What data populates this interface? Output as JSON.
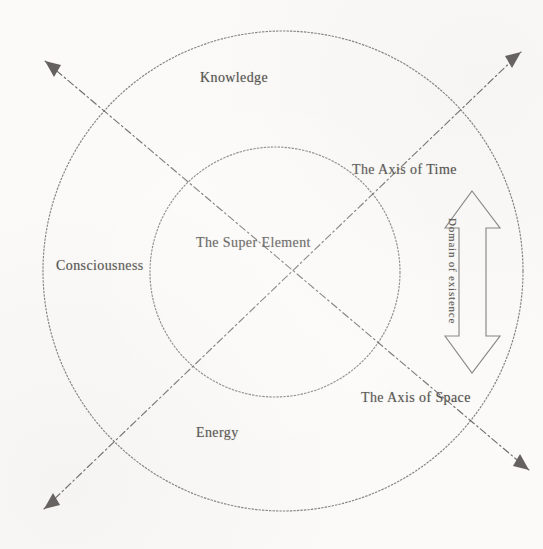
{
  "diagram": {
    "title": "The Super Element",
    "background_color": "#fbfaf8",
    "stroke_color": "#55524f",
    "text_color": "#3c3a38",
    "outer_circle": {
      "name": "outer-circle",
      "center_x": 283,
      "center_y": 271,
      "radius": 240
    },
    "inner_circle": {
      "name": "inner-circle",
      "center_x": 275,
      "center_y": 272,
      "radius": 125
    },
    "labels": {
      "knowledge": "Knowledge",
      "consciousness": "Consciousness",
      "energy": "Energy",
      "super_element": "The Super Element",
      "axis_of_time": "The Axis of Time",
      "axis_of_space": "The Axis of Space",
      "domain_of_existence": "Domain of existence"
    },
    "axes": [
      {
        "name": "axis-of-time",
        "label": "The Axis of Time",
        "style": "dash-dot",
        "from_x": 51,
        "from_y": 501,
        "to_x": 515,
        "to_y": 57,
        "arrowheads": "both"
      },
      {
        "name": "axis-of-space",
        "label": "The Axis of Space",
        "style": "dash-dot",
        "from_x": 51,
        "from_y": 68,
        "to_x": 523,
        "to_y": 465,
        "arrowheads": "both"
      }
    ],
    "domain_arrow": {
      "name": "domain-of-existence-arrow",
      "label": "Domain of existence",
      "orientation": "vertical",
      "double_headed": true,
      "top_y": 192,
      "bottom_y": 372,
      "left_x": 445,
      "right_x": 500
    }
  }
}
